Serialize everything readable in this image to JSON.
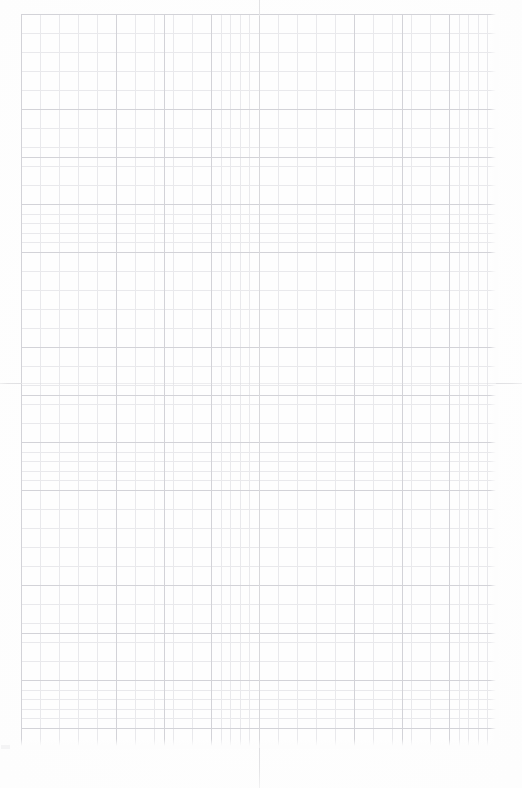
{
  "document": {
    "kind": "graph-paper-scan",
    "title": "Blank graph paper sheet",
    "page_width_px": 522,
    "page_height_px": 788,
    "background_color": "#fdfdfd",
    "visible_text": "",
    "notes": "No text, labels, numbers or glyphs are rendered anywhere on the sheet."
  },
  "grid": {
    "left_px": 21,
    "top_px": 14,
    "width_px": 476,
    "height_px": 734,
    "minor_cell_px": 9.52,
    "major_every_n_cells": 5,
    "major_spacing_px": 47.6,
    "minor_columns": 50,
    "minor_rows": 77,
    "major_columns": 10,
    "major_rows": 15,
    "minor_line_color": "#e9e9ec",
    "major_line_color": "#d3d3d8",
    "minor_line_width_px": 0.6,
    "major_line_width_px": 0.85
  },
  "registration_marks": {
    "vertical_axis_x_px": 259,
    "horizontal_axis_y_px": 383,
    "color": "#e2e2e4",
    "marks": [
      {
        "name": "top-tick",
        "orientation": "vertical",
        "x_px": 259,
        "y_px": 0,
        "length_px": 16
      },
      {
        "name": "bottom-tick",
        "orientation": "vertical",
        "x_px": 259,
        "y_px": 748,
        "length_px": 40
      },
      {
        "name": "left-tick",
        "orientation": "horizontal",
        "x_px": 0,
        "y_px": 383,
        "length_px": 22
      },
      {
        "name": "right-tick",
        "orientation": "horizontal",
        "x_px": 496,
        "y_px": 383,
        "length_px": 26
      }
    ]
  },
  "margins": {
    "left_px": 21,
    "top_px": 14,
    "right_px": 25,
    "bottom_px": 40
  }
}
